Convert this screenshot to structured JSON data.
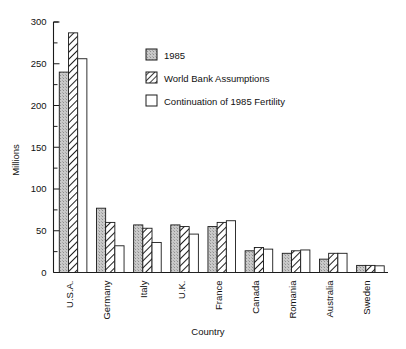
{
  "chart_data": {
    "type": "bar",
    "title": "",
    "xlabel": "Country",
    "ylabel": "Millions",
    "ylim": [
      0,
      300
    ],
    "yticks": [
      0,
      50,
      100,
      150,
      200,
      250,
      300
    ],
    "ytick_labels": [
      "0",
      "50",
      "100",
      "150",
      "200",
      "250",
      "300"
    ],
    "minor_tick_step": 25,
    "grid": false,
    "legend_position": "upper-right-inside",
    "categories": [
      "U.S.A.",
      "Germany",
      "Italy",
      "U.K.",
      "France",
      "Canada",
      "Romania",
      "Australia",
      "Sweden"
    ],
    "series": [
      {
        "name": "1985",
        "pattern": "solid-gray-stipple",
        "color": "#b0b0b0",
        "values": [
          240,
          77,
          57,
          57,
          55,
          26,
          23,
          16,
          8.5
        ]
      },
      {
        "name": "World Bank Assumptions",
        "pattern": "diagonal-hatch",
        "color": "#ffffff",
        "values": [
          287,
          60,
          53,
          55,
          60,
          30,
          26,
          23,
          8.5
        ]
      },
      {
        "name": "Continuation of 1985 Fertility",
        "pattern": "white-empty",
        "color": "#ffffff",
        "values": [
          256,
          32,
          36,
          46,
          62,
          28,
          27,
          23,
          8
        ]
      }
    ]
  },
  "axis": {
    "y_title": "Millions",
    "x_title": "Country"
  },
  "legend": {
    "entries": [
      {
        "label": "1985",
        "swatch": "solid-gray-swatch"
      },
      {
        "label": "World Bank Assumptions",
        "swatch": "hatched-swatch"
      },
      {
        "label": "Continuation of 1985 Fertility",
        "swatch": "white-swatch"
      }
    ]
  }
}
